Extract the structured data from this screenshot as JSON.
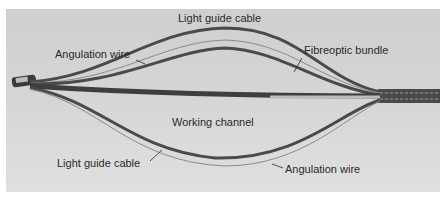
{
  "figure": {
    "labels": {
      "light_guide_cable_top": "Light guide cable",
      "angulation_wire_top": "Angulation wire",
      "fibreoptic_bundle": "Fibreoptic bundle",
      "working_channel": "Working channel",
      "light_guide_cable_bottom": "Light guide cable",
      "angulation_wire_bottom": "Angulation wire"
    },
    "colors": {
      "background": "#d4d4d4",
      "cable_dark": "#4a4a4a",
      "wire_light": "#8a8a8a",
      "text": "#2a2a2a"
    }
  }
}
